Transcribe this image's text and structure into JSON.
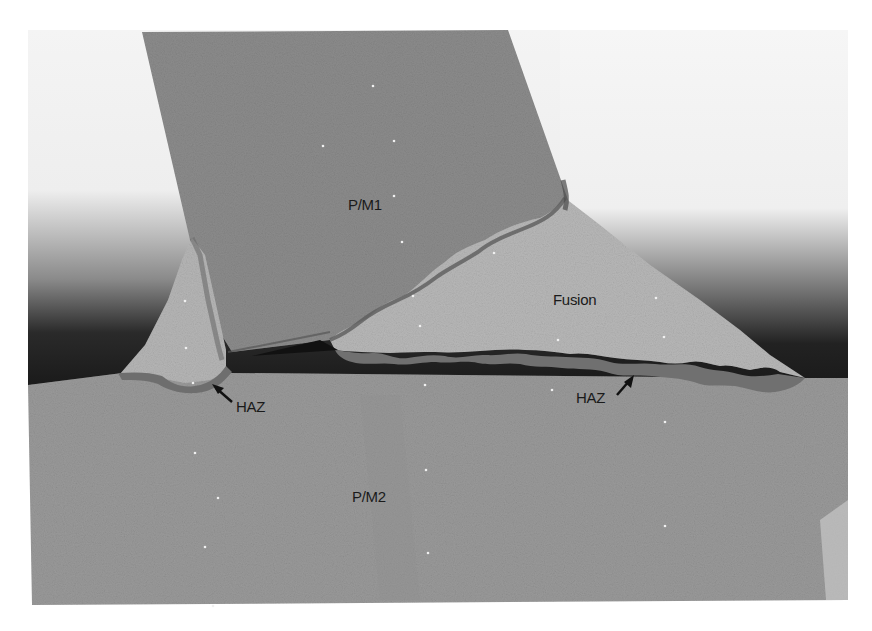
{
  "figure": {
    "labels": {
      "parent_metal_1": "P/M1",
      "fusion_zone": "Fusion",
      "haz_left": "HAZ",
      "haz_right": "HAZ",
      "parent_metal_2": "P/M2"
    },
    "colors": {
      "background": "#ffffff",
      "parent_metal_1": "#8e8e8e",
      "parent_metal_2": "#989898",
      "fusion_zone": "#b4b4b4",
      "haz": "#6e6e6e",
      "shadow": "#1e1e1e"
    }
  }
}
